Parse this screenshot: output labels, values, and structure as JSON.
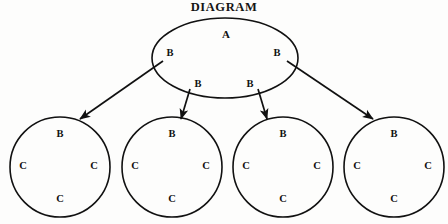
{
  "title": "DIAGRAM",
  "colors": {
    "background": "#fdfdfc",
    "stroke": "#111111",
    "text": "#111111"
  },
  "root_node": {
    "shape": "ellipse",
    "center_label": "A",
    "child_labels": [
      "B",
      "B",
      "B",
      "B"
    ],
    "cx": 225,
    "cy": 58,
    "rx": 73,
    "ry": 40,
    "label_positions": [
      {
        "text": "A",
        "x": 226,
        "y": 34
      },
      {
        "text": "B",
        "x": 170,
        "y": 53
      },
      {
        "text": "B",
        "x": 277,
        "y": 53
      },
      {
        "text": "B",
        "x": 198,
        "y": 84
      },
      {
        "text": "B",
        "x": 250,
        "y": 84
      }
    ]
  },
  "leaf_nodes": [
    {
      "shape": "circle",
      "cx": 60,
      "cy": 167,
      "r": 50,
      "top_label": "B",
      "inner_labels": [
        "C",
        "C",
        "C"
      ],
      "label_positions": [
        {
          "text": "B",
          "x": 60,
          "y": 134
        },
        {
          "text": "C",
          "x": 23,
          "y": 166
        },
        {
          "text": "C",
          "x": 94,
          "y": 166
        },
        {
          "text": "C",
          "x": 60,
          "y": 199
        }
      ]
    },
    {
      "shape": "circle",
      "cx": 172,
      "cy": 167,
      "r": 50,
      "top_label": "B",
      "inner_labels": [
        "C",
        "C",
        "C"
      ],
      "label_positions": [
        {
          "text": "B",
          "x": 172,
          "y": 134
        },
        {
          "text": "C",
          "x": 135,
          "y": 166
        },
        {
          "text": "C",
          "x": 206,
          "y": 166
        },
        {
          "text": "C",
          "x": 172,
          "y": 199
        }
      ]
    },
    {
      "shape": "circle",
      "cx": 283,
      "cy": 167,
      "r": 50,
      "top_label": "B",
      "inner_labels": [
        "C",
        "C",
        "C"
      ],
      "label_positions": [
        {
          "text": "B",
          "x": 283,
          "y": 134
        },
        {
          "text": "C",
          "x": 246,
          "y": 166
        },
        {
          "text": "C",
          "x": 317,
          "y": 166
        },
        {
          "text": "C",
          "x": 283,
          "y": 199
        }
      ]
    },
    {
      "shape": "circle",
      "cx": 394,
      "cy": 167,
      "r": 50,
      "top_label": "B",
      "inner_labels": [
        "C",
        "C",
        "C"
      ],
      "label_positions": [
        {
          "text": "B",
          "x": 394,
          "y": 134
        },
        {
          "text": "C",
          "x": 357,
          "y": 166
        },
        {
          "text": "C",
          "x": 428,
          "y": 166
        },
        {
          "text": "C",
          "x": 394,
          "y": 199
        }
      ]
    }
  ],
  "arrows": [
    {
      "name": "arrow-root-to-leaf-1",
      "x1": 163,
      "y1": 61,
      "x2": 80,
      "y2": 119
    },
    {
      "name": "arrow-root-to-leaf-2",
      "x1": 190,
      "y1": 89,
      "x2": 181,
      "y2": 119
    },
    {
      "name": "arrow-root-to-leaf-3",
      "x1": 258,
      "y1": 89,
      "x2": 267,
      "y2": 119
    },
    {
      "name": "arrow-root-to-leaf-4",
      "x1": 287,
      "y1": 61,
      "x2": 373,
      "y2": 119
    }
  ]
}
